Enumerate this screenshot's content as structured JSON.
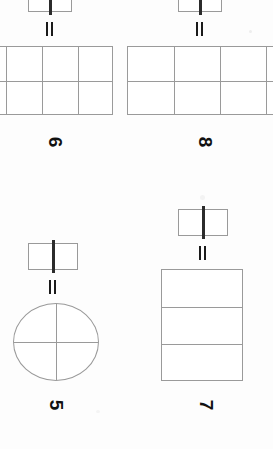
{
  "page": {
    "kind": "scanned-math-worksheet",
    "orientation": "rotated-90-clockwise",
    "background_color": "#fdfdfd",
    "ink_color": "#9a9a9a",
    "bold_ink_color": "#1a1a1a"
  },
  "problems": [
    {
      "number": "6",
      "equals": "=",
      "left_figure": {
        "type": "bar",
        "rows": 1,
        "cols": 2,
        "bold_divider": true
      },
      "right_figure": {
        "type": "grid",
        "rows": 2,
        "cols": 3,
        "clipped_edge": "left"
      }
    },
    {
      "number": "8",
      "equals": "=",
      "left_figure": {
        "type": "bar",
        "rows": 1,
        "cols": 2,
        "bold_divider": true
      },
      "right_figure": {
        "type": "grid",
        "rows": 2,
        "cols": 4,
        "clipped_edge": "right"
      }
    },
    {
      "number": "5",
      "equals": "=",
      "left_figure": {
        "type": "bar",
        "rows": 1,
        "cols": 2,
        "bold_divider": true
      },
      "right_figure": {
        "type": "circle",
        "parts": 4,
        "clipped_edge": "none"
      }
    },
    {
      "number": "7",
      "equals": "=",
      "left_figure": {
        "type": "bar",
        "rows": 1,
        "cols": 2,
        "bold_divider": true
      },
      "right_figure": {
        "type": "grid",
        "rows": 3,
        "cols": 1,
        "clipped_edge": "none"
      }
    }
  ]
}
